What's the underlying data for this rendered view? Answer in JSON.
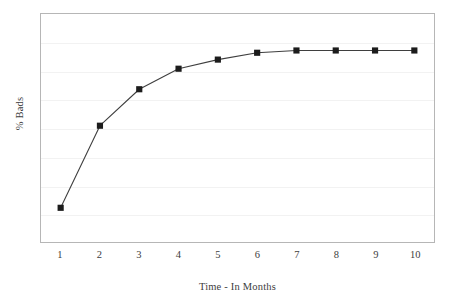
{
  "chart_data": {
    "type": "line",
    "title": "",
    "xlabel": "Time - In Months",
    "ylabel": "% Bads",
    "categories": [
      "1",
      "2",
      "3",
      "4",
      "5",
      "6",
      "7",
      "8",
      "9",
      "10"
    ],
    "x": [
      1,
      2,
      3,
      4,
      5,
      6,
      7,
      8,
      9,
      10
    ],
    "values": [
      15,
      51,
      67,
      76,
      80,
      83,
      84,
      84,
      84,
      84
    ],
    "series": [
      {
        "name": "% Bads",
        "values": [
          15,
          51,
          67,
          76,
          80,
          83,
          84,
          84,
          84,
          84
        ]
      }
    ],
    "xlim": [
      0.5,
      10.5
    ],
    "ylim": [
      0,
      100
    ],
    "grid": true,
    "gridline_count": 7,
    "y_tick_labels": [],
    "legend": "none",
    "marker": "square",
    "marker_color": "#1c1c1c",
    "line_color": "#3f3f3f",
    "frame_color": "#b6b6b6",
    "gridline_color": "#f2f2f2",
    "background": "#ffffff",
    "annotations": []
  },
  "axes": {
    "y_title": "% Bads",
    "x_title": "Time - In Months"
  }
}
